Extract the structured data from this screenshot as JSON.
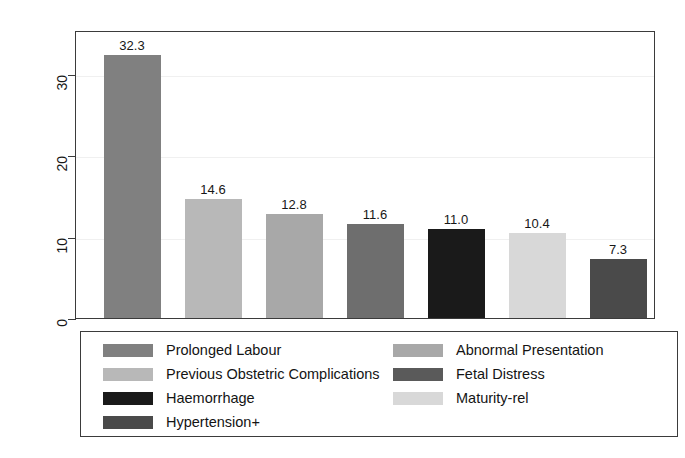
{
  "chart_data": {
    "type": "bar",
    "title": "",
    "subtitle": "",
    "xlabel": "",
    "ylabel": "",
    "categories": [
      "Prolonged Labour",
      "Previous Obstetric Complications",
      "Abnormal Presentation",
      "Hypertension+",
      "Haemorrhage",
      "Maturity-rel",
      "Fetal Distress"
    ],
    "values": [
      32.3,
      14.6,
      12.8,
      11.6,
      11.0,
      10.4,
      7.3
    ],
    "value_labels": [
      "32.3",
      "14.6",
      "12.8",
      "11.6",
      "11.0",
      "10.4",
      "7.3"
    ],
    "bar_colors": [
      "#808080",
      "#b8b8b8",
      "#a8a8a8",
      "#6e6e6e",
      "#1a1a1a",
      "#d8d8d8",
      "#4a4a4a"
    ],
    "ylim": [
      0,
      35
    ],
    "yticks": [
      0,
      10,
      20,
      30
    ],
    "ytick_labels": [
      "0",
      "10",
      "20",
      "30"
    ],
    "grid": true,
    "grid_axis": "y",
    "legend_position": "bottom"
  },
  "axes": {
    "y": {
      "ticks": [
        {
          "label": "30",
          "value": 30
        },
        {
          "label": "20",
          "value": 20
        },
        {
          "label": "10",
          "value": 10
        },
        {
          "label": "0",
          "value": 0
        }
      ]
    }
  },
  "legend": {
    "columns": [
      {
        "entries": [
          {
            "label": "Prolonged Labour",
            "color": "#808080"
          },
          {
            "label": "Previous Obstetric Complications",
            "color": "#b8b8b8"
          },
          {
            "label": "Haemorrhage",
            "color": "#1a1a1a"
          },
          {
            "label": "Hypertension+",
            "color": "#4a4a4a"
          }
        ]
      },
      {
        "entries": [
          {
            "label": "Abnormal Presentation",
            "color": "#a8a8a8"
          },
          {
            "label": "Fetal Distress",
            "color": "#5a5a5a"
          },
          {
            "label": "Maturity-rel",
            "color": "#d8d8d8"
          }
        ]
      }
    ]
  }
}
